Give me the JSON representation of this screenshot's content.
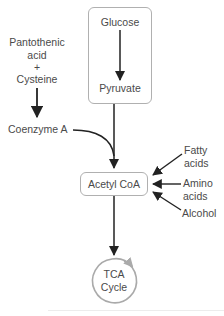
{
  "diagram": {
    "nodes": {
      "glucose": "Glucose",
      "pyruvate": "Pyruvate",
      "pantothenic_line1": "Pantothenic",
      "pantothenic_line2": "acid",
      "plus": "+",
      "cysteine": "Cysteine",
      "coenzyme_a": "Coenzyme A",
      "acetyl_coa": "Acetyl CoA",
      "fatty_line1": "Fatty",
      "fatty_line2": "acids",
      "amino_line1": "Amino",
      "amino_line2": "acids",
      "alcohol": "Alcohol",
      "tca_line1": "TCA",
      "tca_line2": "Cycle"
    },
    "edges": [
      {
        "from": "Glucose",
        "to": "Pyruvate"
      },
      {
        "from": "Pantothenic acid + Cysteine",
        "to": "Coenzyme A"
      },
      {
        "from": "Pyruvate",
        "to": "Acetyl CoA"
      },
      {
        "from": "Coenzyme A",
        "to": "Acetyl CoA"
      },
      {
        "from": "Fatty acids",
        "to": "Acetyl CoA"
      },
      {
        "from": "Amino acids",
        "to": "Acetyl CoA"
      },
      {
        "from": "Alcohol",
        "to": "Acetyl CoA"
      },
      {
        "from": "Acetyl CoA",
        "to": "TCA Cycle"
      }
    ],
    "colors": {
      "arrow": "#222222",
      "box_border": "#b0b0b0",
      "cycle": "#aaaaaa",
      "text": "#4a4a4a"
    }
  }
}
